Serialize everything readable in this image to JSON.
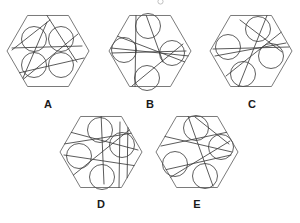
{
  "figure": {
    "canvas": {
      "width": 300,
      "height": 223
    },
    "colors": {
      "background": "#ffffff",
      "hexagon_stroke": "#6b6b6b",
      "circle_stroke": "#4d4d4d",
      "line_stroke": "#3d3d3d",
      "label_text": "#1a1a1a",
      "artifact_stroke": "#b9b9b9"
    },
    "artifact": {
      "name": "cropped-glyph-top",
      "cx": 160.5,
      "cy": 1.5,
      "r": 2.6
    }
  },
  "panels": [
    {
      "id": "A",
      "label": "A",
      "label_x": 48,
      "label_y": 105,
      "hexagon": {
        "cx": 48,
        "cy": 51,
        "r": 41,
        "rotation": 0
      },
      "circles": [
        {
          "cx": 34,
          "cy": 39,
          "r": 12.5
        },
        {
          "cx": 61,
          "cy": 39,
          "r": 12.5
        },
        {
          "cx": 34,
          "cy": 65,
          "r": 12.5
        },
        {
          "cx": 61,
          "cy": 65,
          "r": 12.5
        }
      ],
      "lines": [
        {
          "x1": 12,
          "y1": 50,
          "x2": 50,
          "y2": 20
        },
        {
          "x1": 46,
          "y1": 14,
          "x2": 77,
          "y2": 62
        },
        {
          "x1": 14,
          "y1": 74,
          "x2": 84,
          "y2": 58
        },
        {
          "x1": 20,
          "y1": 82,
          "x2": 78,
          "y2": 34
        },
        {
          "x1": 47,
          "y1": 22,
          "x2": 23,
          "y2": 78
        },
        {
          "x1": 12,
          "y1": 48,
          "x2": 82,
          "y2": 46
        }
      ]
    },
    {
      "id": "B",
      "label": "B",
      "label_x": 150,
      "label_y": 105,
      "hexagon": {
        "cx": 150,
        "cy": 51,
        "r": 41,
        "rotation": 0
      },
      "circles": [
        {
          "cx": 148,
          "cy": 26,
          "r": 12.5
        },
        {
          "cx": 124,
          "cy": 50,
          "r": 12.5
        },
        {
          "cx": 172,
          "cy": 53,
          "r": 12.5
        },
        {
          "cx": 147,
          "cy": 78,
          "r": 12.5
        }
      ],
      "lines": [
        {
          "x1": 145,
          "y1": 12,
          "x2": 163,
          "y2": 62
        },
        {
          "x1": 111,
          "y1": 48,
          "x2": 189,
          "y2": 56
        },
        {
          "x1": 112,
          "y1": 53,
          "x2": 186,
          "y2": 51
        },
        {
          "x1": 136,
          "y1": 14,
          "x2": 135,
          "y2": 90
        },
        {
          "x1": 117,
          "y1": 36,
          "x2": 185,
          "y2": 62
        },
        {
          "x1": 132,
          "y1": 86,
          "x2": 183,
          "y2": 44
        }
      ]
    },
    {
      "id": "C",
      "label": "C",
      "label_x": 252,
      "label_y": 105,
      "hexagon": {
        "cx": 251,
        "cy": 51,
        "r": 41,
        "rotation": 0
      },
      "circles": [
        {
          "cx": 258,
          "cy": 29,
          "r": 12.5
        },
        {
          "cx": 228,
          "cy": 47,
          "r": 12.5
        },
        {
          "cx": 271,
          "cy": 56,
          "r": 12.5
        },
        {
          "cx": 243,
          "cy": 74,
          "r": 12.5
        }
      ],
      "lines": [
        {
          "x1": 268,
          "y1": 13,
          "x2": 238,
          "y2": 88
        },
        {
          "x1": 213,
          "y1": 49,
          "x2": 289,
          "y2": 47
        },
        {
          "x1": 215,
          "y1": 56,
          "x2": 286,
          "y2": 43
        },
        {
          "x1": 226,
          "y1": 76,
          "x2": 284,
          "y2": 30
        },
        {
          "x1": 240,
          "y1": 20,
          "x2": 282,
          "y2": 52
        }
      ]
    },
    {
      "id": "D",
      "label": "D",
      "label_x": 101,
      "label_y": 205,
      "hexagon": {
        "cx": 101,
        "cy": 152,
        "r": 41,
        "rotation": 0
      },
      "circles": [
        {
          "cx": 100,
          "cy": 130,
          "r": 12.5
        },
        {
          "cx": 79,
          "cy": 156,
          "r": 12.5
        },
        {
          "cx": 122,
          "cy": 145,
          "r": 12.5
        },
        {
          "cx": 102,
          "cy": 177,
          "r": 12.5
        }
      ],
      "lines": [
        {
          "x1": 101,
          "y1": 113,
          "x2": 104,
          "y2": 184
        },
        {
          "x1": 64,
          "y1": 144,
          "x2": 139,
          "y2": 132
        },
        {
          "x1": 66,
          "y1": 131,
          "x2": 138,
          "y2": 150
        },
        {
          "x1": 64,
          "y1": 155,
          "x2": 137,
          "y2": 166
        },
        {
          "x1": 71,
          "y1": 177,
          "x2": 133,
          "y2": 127
        },
        {
          "x1": 120,
          "y1": 122,
          "x2": 119,
          "y2": 188
        },
        {
          "x1": 128,
          "y1": 122,
          "x2": 127,
          "y2": 186
        }
      ]
    },
    {
      "id": "E",
      "label": "E",
      "label_x": 197,
      "label_y": 205,
      "hexagon": {
        "cx": 197,
        "cy": 152,
        "r": 41,
        "rotation": 0
      },
      "circles": [
        {
          "cx": 196,
          "cy": 128,
          "r": 12.5
        },
        {
          "cx": 221,
          "cy": 147,
          "r": 12.5
        },
        {
          "cx": 175,
          "cy": 164,
          "r": 12.5
        },
        {
          "cx": 205,
          "cy": 176,
          "r": 12.5
        }
      ],
      "lines": [
        {
          "x1": 188,
          "y1": 116,
          "x2": 213,
          "y2": 186
        },
        {
          "x1": 161,
          "y1": 146,
          "x2": 233,
          "y2": 131
        },
        {
          "x1": 163,
          "y1": 136,
          "x2": 232,
          "y2": 152
        },
        {
          "x1": 160,
          "y1": 171,
          "x2": 231,
          "y2": 155
        },
        {
          "x1": 166,
          "y1": 180,
          "x2": 230,
          "y2": 141
        },
        {
          "x1": 195,
          "y1": 117,
          "x2": 229,
          "y2": 144
        }
      ]
    }
  ]
}
